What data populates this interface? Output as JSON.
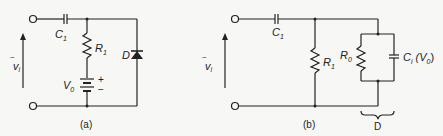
{
  "figure_a": {
    "caption": "(a)",
    "input_label": "v",
    "input_sub": "i",
    "capacitor_label": "C",
    "capacitor_sub": "1",
    "resistor_label": "R",
    "resistor_sub": "1",
    "battery_label": "V",
    "battery_sub": "0",
    "battery_plus": "+",
    "battery_minus": "−",
    "diode_label": "D"
  },
  "figure_b": {
    "caption": "(b)",
    "input_label": "v",
    "input_sub": "i",
    "capacitor_label": "C",
    "capacitor_sub": "1",
    "resistor_label": "R",
    "resistor_sub": "1",
    "r0_label": "R",
    "r0_sub": "0",
    "ci_label": "C",
    "ci_sub": "i",
    "ci_arg_open": " (V",
    "ci_arg_sub": "0",
    "ci_arg_close": ")",
    "brace_label": "D"
  }
}
